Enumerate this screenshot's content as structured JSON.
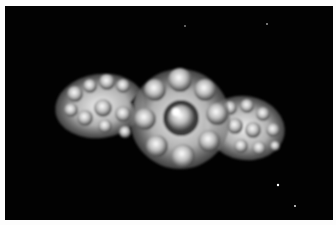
{
  "image": {
    "subject": "diamond cluster ring",
    "background_color": "#020202",
    "border_color": "#fdfdfd",
    "stone_color": "#e8e8e8",
    "shadow_color": "#3a3a3a"
  }
}
